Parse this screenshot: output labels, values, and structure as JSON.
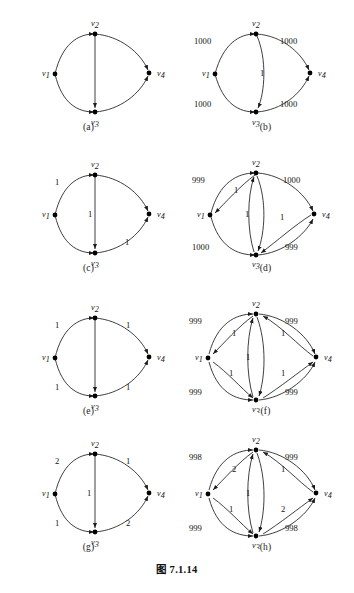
{
  "figure": {
    "caption": "图 7.1.14",
    "vertex_labels": {
      "v1": "v",
      "v2": "v",
      "v3": "v",
      "v4": "v"
    },
    "vertex_subscripts": {
      "v1": "1",
      "v2": "2",
      "v3": "3",
      "v4": "4"
    }
  },
  "panels": [
    {
      "id": "a",
      "subcaption": "(a)",
      "nodes": [
        "v1",
        "v2",
        "v3",
        "v4"
      ],
      "edges": [
        {
          "from": "v1",
          "to": "v2",
          "label": ""
        },
        {
          "from": "v1",
          "to": "v3",
          "label": ""
        },
        {
          "from": "v2",
          "to": "v4",
          "label": ""
        },
        {
          "from": "v3",
          "to": "v4",
          "label": ""
        },
        {
          "from": "v2",
          "to": "v3",
          "label": ""
        }
      ],
      "labels": {
        "tl": "",
        "tr": "",
        "bl": "",
        "br": "",
        "mid": "",
        "il": "",
        "ir": "",
        "ibl": "",
        "ibr": ""
      }
    },
    {
      "id": "b",
      "subcaption": "(b)",
      "nodes": [
        "v1",
        "v2",
        "v3",
        "v4"
      ],
      "edges": [
        {
          "from": "v1",
          "to": "v2",
          "label": "1000"
        },
        {
          "from": "v2",
          "to": "v4",
          "label": "1000"
        },
        {
          "from": "v1",
          "to": "v3",
          "label": "1000"
        },
        {
          "from": "v3",
          "to": "v4",
          "label": "1000"
        },
        {
          "from": "v2",
          "to": "v3",
          "label": "1"
        }
      ],
      "labels": {
        "tl": "1000",
        "tr": "1000",
        "bl": "1000",
        "br": "1000",
        "mid": "1"
      }
    },
    {
      "id": "c",
      "subcaption": "(c)",
      "nodes": [
        "v1",
        "v2",
        "v3",
        "v4"
      ],
      "edges": [
        {
          "from": "v1",
          "to": "v2",
          "label": "1"
        },
        {
          "from": "v2",
          "to": "v4",
          "label": ""
        },
        {
          "from": "v1",
          "to": "v3",
          "label": ""
        },
        {
          "from": "v3",
          "to": "v4",
          "label": "1"
        },
        {
          "from": "v2",
          "to": "v3",
          "label": "1"
        }
      ],
      "labels": {
        "tl": "1",
        "tr": "",
        "bl": "",
        "br": "1",
        "mid": "1"
      }
    },
    {
      "id": "d",
      "subcaption": "(d)",
      "nodes": [
        "v1",
        "v2",
        "v3",
        "v4"
      ],
      "edges": [
        {
          "from": "v1",
          "to": "v2",
          "label": "999"
        },
        {
          "from": "v2",
          "to": "v4",
          "label": "1000"
        },
        {
          "from": "v1",
          "to": "v3",
          "label": "1000"
        },
        {
          "from": "v3",
          "to": "v4",
          "label": "999"
        },
        {
          "from": "v2",
          "to": "v1",
          "label": "1"
        },
        {
          "from": "v4",
          "to": "v3",
          "label": "1"
        },
        {
          "from": "v2",
          "to": "v3",
          "label": "1"
        },
        {
          "from": "v3",
          "to": "v2",
          "label": ""
        }
      ],
      "labels": {
        "tl": "999",
        "tr": "1000",
        "bl": "1000",
        "br": "999",
        "mid": "1",
        "il": "1",
        "ir": "1"
      }
    },
    {
      "id": "e",
      "subcaption": "(e)",
      "nodes": [
        "v1",
        "v2",
        "v3",
        "v4"
      ],
      "edges": [
        {
          "from": "v1",
          "to": "v2",
          "label": "1"
        },
        {
          "from": "v2",
          "to": "v4",
          "label": "1"
        },
        {
          "from": "v1",
          "to": "v3",
          "label": "1"
        },
        {
          "from": "v3",
          "to": "v4",
          "label": "1"
        },
        {
          "from": "v2",
          "to": "v3",
          "label": ""
        }
      ],
      "labels": {
        "tl": "1",
        "tr": "1",
        "bl": "1",
        "br": "1",
        "mid": ""
      }
    },
    {
      "id": "f",
      "subcaption": "(f)",
      "nodes": [
        "v1",
        "v2",
        "v3",
        "v4"
      ],
      "edges": [
        {
          "from": "v1",
          "to": "v2",
          "label": "999"
        },
        {
          "from": "v2",
          "to": "v4",
          "label": "999"
        },
        {
          "from": "v1",
          "to": "v3",
          "label": "999"
        },
        {
          "from": "v3",
          "to": "v4",
          "label": "999"
        },
        {
          "from": "v2",
          "to": "v1",
          "label": "1"
        },
        {
          "from": "v4",
          "to": "v2",
          "label": "1"
        },
        {
          "from": "v1",
          "to": "v3",
          "label": "1"
        },
        {
          "from": "v3",
          "to": "v4",
          "label": "1"
        },
        {
          "from": "v2",
          "to": "v3",
          "label": "1"
        }
      ],
      "labels": {
        "tl": "999",
        "tr": "999",
        "bl": "999",
        "br": "999",
        "mid": "1",
        "il": "1",
        "ir": "1",
        "ibl": "1",
        "ibr": "1"
      }
    },
    {
      "id": "g",
      "subcaption": "(g)",
      "nodes": [
        "v1",
        "v2",
        "v3",
        "v4"
      ],
      "edges": [
        {
          "from": "v1",
          "to": "v2",
          "label": "2"
        },
        {
          "from": "v2",
          "to": "v4",
          "label": "1"
        },
        {
          "from": "v1",
          "to": "v3",
          "label": "1"
        },
        {
          "from": "v3",
          "to": "v4",
          "label": "2"
        },
        {
          "from": "v2",
          "to": "v3",
          "label": "1"
        }
      ],
      "labels": {
        "tl": "2",
        "tr": "1",
        "bl": "1",
        "br": "2",
        "mid": "1"
      }
    },
    {
      "id": "h",
      "subcaption": "(h)",
      "nodes": [
        "v1",
        "v2",
        "v3",
        "v4"
      ],
      "edges": [
        {
          "from": "v1",
          "to": "v2",
          "label": "998"
        },
        {
          "from": "v2",
          "to": "v4",
          "label": "999"
        },
        {
          "from": "v1",
          "to": "v3",
          "label": "999"
        },
        {
          "from": "v3",
          "to": "v4",
          "label": "998"
        },
        {
          "from": "v2",
          "to": "v1",
          "label": "2"
        },
        {
          "from": "v4",
          "to": "v2",
          "label": "1"
        },
        {
          "from": "v1",
          "to": "v3",
          "label": "1"
        },
        {
          "from": "v3",
          "to": "v4",
          "label": "2"
        },
        {
          "from": "v2",
          "to": "v3",
          "label": "1"
        }
      ],
      "labels": {
        "tl": "998",
        "tr": "999",
        "bl": "999",
        "br": "998",
        "mid": "1",
        "il": "2",
        "ir": "1",
        "ibl": "1",
        "ibr": "2"
      }
    }
  ]
}
